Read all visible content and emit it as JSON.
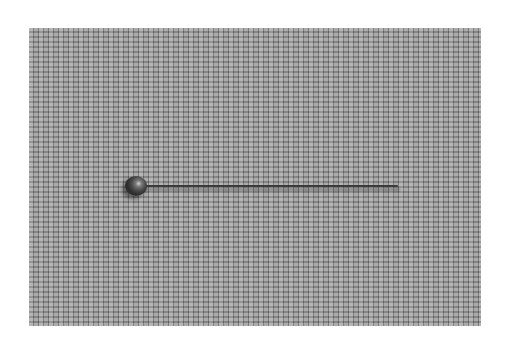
{
  "image": {
    "description": "Photograph of a single round-headed pin lying horizontally on a grey woven fabric",
    "background_color": "#ffffff",
    "fabric_color": "#9a9a9a",
    "pin_head_color": "#3a3a3a",
    "pin_shaft_color": "#3a3a3a"
  }
}
